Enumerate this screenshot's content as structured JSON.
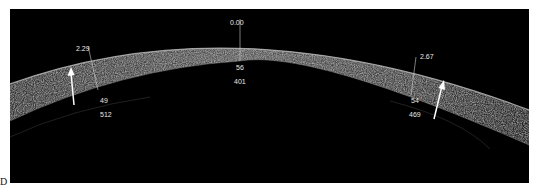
{
  "figure": {
    "panel_label": "D",
    "image_type": "anterior segment OCT of cornea",
    "colors": {
      "background": "#000000",
      "tissue": "#8a8a8a",
      "annotation": "#e8e8e8"
    }
  },
  "measurements": {
    "center": {
      "offset_mm": "0.00",
      "epithelium_um": "56",
      "total_um": "401"
    },
    "left": {
      "offset_mm": "2.29",
      "epithelium_um": "49",
      "total_um": "512"
    },
    "right": {
      "offset_mm": "2.67",
      "epithelium_um": "54",
      "total_um": "469"
    }
  },
  "arrows": [
    {
      "name": "left-arrow",
      "direction": "up"
    },
    {
      "name": "right-arrow",
      "direction": "up"
    }
  ]
}
